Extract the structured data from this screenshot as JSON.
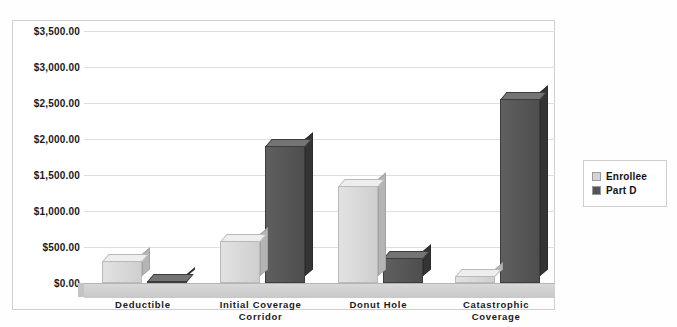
{
  "chart_data": {
    "type": "bar",
    "title": "",
    "subtitle": "",
    "xlabel": "",
    "ylabel": "",
    "ylim": [
      0,
      3500
    ],
    "ytick_step": 500,
    "grid": true,
    "legend_position": "right",
    "style": "3d-clustered-column",
    "categories": [
      "Deductible",
      "Initial Coverage Corridor",
      "Donut Hole",
      "Catastrophic Coverage"
    ],
    "ytick_labels": [
      "$0.00",
      "$500.00",
      "$1,000.00",
      "$1,500.00",
      "$2,000.00",
      "$2,500.00",
      "$3,000.00",
      "$3,500.00"
    ],
    "ytick_values": [
      0,
      500,
      1000,
      1500,
      2000,
      2500,
      3000,
      3500
    ],
    "series": [
      {
        "name": "Enrollee",
        "color": "#d4d4d4",
        "values": [
          310,
          580,
          1350,
          95
        ]
      },
      {
        "name": "Part D",
        "color": "#545454",
        "values": [
          0,
          1900,
          350,
          2560
        ]
      }
    ]
  },
  "legend": {
    "items": [
      {
        "label": "Enrollee",
        "color": "#d4d4d4"
      },
      {
        "label": "Part D",
        "color": "#545454"
      }
    ]
  },
  "colors": {
    "enrollee": "#d4d4d4",
    "part_d": "#545454",
    "gridline": "#dedede",
    "frame": "#cfcfcf",
    "background": "#ffffff",
    "text": "#1a1a1a"
  }
}
